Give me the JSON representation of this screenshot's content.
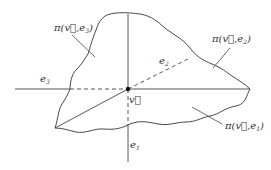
{
  "diagram": {
    "origin_label": "v⃗",
    "axes": [
      {
        "id": "e1",
        "label": "e",
        "subscript": "1",
        "direction": "down"
      },
      {
        "id": "e2",
        "label": "e",
        "subscript": "2",
        "direction": "up-right (dashed)"
      },
      {
        "id": "e3",
        "label": "e",
        "subscript": "3",
        "direction": "left"
      }
    ],
    "regions": [
      {
        "id": "pi-v-e3",
        "text": "π(v⃗,e",
        "subscript": "3",
        "close": ")"
      },
      {
        "id": "pi-v-e2",
        "text": "π(v⃗,e",
        "subscript": "2",
        "close": ")"
      },
      {
        "id": "pi-v-e1",
        "text": "π(v⃗,e",
        "subscript": "1",
        "close": ")"
      }
    ],
    "colors": {
      "stroke": "#333333",
      "background": "#ffffff"
    }
  }
}
